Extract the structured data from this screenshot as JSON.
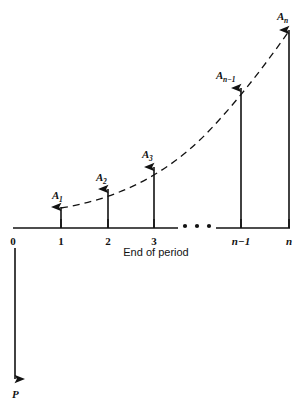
{
  "figure": {
    "type": "cash-flow-diagram",
    "stroke_color": "#121212",
    "background_color": "#ffffff",
    "axis_caption": "End of period",
    "ellipsis": "•  •  •"
  },
  "axis": {
    "label": "End of period",
    "ticks": [
      {
        "id": "t0",
        "label": "0",
        "x": 13,
        "style": "upright"
      },
      {
        "id": "t1",
        "label": "1",
        "x": 61,
        "style": "upright"
      },
      {
        "id": "t2",
        "label": "2",
        "x": 108,
        "style": "upright"
      },
      {
        "id": "t3",
        "label": "3",
        "x": 154,
        "style": "upright"
      },
      {
        "id": "tn1",
        "label": "n−1",
        "x": 241,
        "style": "italic"
      },
      {
        "id": "tn",
        "label": "n",
        "x": 289,
        "style": "italic"
      }
    ],
    "baseline_y": 228,
    "segments": [
      {
        "x1": 13,
        "x2": 178
      },
      {
        "x1": 216,
        "x2": 290
      }
    ],
    "break_dots": [
      {
        "x": 185,
        "y": 226
      },
      {
        "x": 197,
        "y": 226
      },
      {
        "x": 209,
        "y": 226
      }
    ]
  },
  "arrows": {
    "up": [
      {
        "id": "a1",
        "base_label": "A",
        "subscript": "1",
        "x": 61,
        "tip_y": 207,
        "label_x": 52,
        "label_y": 199
      },
      {
        "id": "a2",
        "base_label": "A",
        "subscript": "2",
        "x": 108,
        "tip_y": 189,
        "label_x": 96,
        "label_y": 181
      },
      {
        "id": "a3",
        "base_label": "A",
        "subscript": "3",
        "x": 154,
        "tip_y": 167,
        "label_x": 142,
        "label_y": 158
      },
      {
        "id": "an1",
        "base_label": "A",
        "subscript": "n−1",
        "x": 241,
        "tip_y": 88,
        "label_x": 216,
        "label_y": 79
      },
      {
        "id": "an",
        "base_label": "A",
        "subscript": "n",
        "x": 289,
        "tip_y": 30,
        "label_x": 277,
        "label_y": 20
      }
    ],
    "down": [
      {
        "id": "p",
        "base_label": "P",
        "subscript": "",
        "x": 15,
        "top_y": 248,
        "tip_y": 379,
        "label_x": 12,
        "label_y": 397
      }
    ]
  },
  "curve": {
    "style": "dashed",
    "description": "dashed increasing convex curve through the arrow tips",
    "path": "M 61 208 C 110 200, 160 180, 205 135 C 240 99, 270 58, 289 31"
  }
}
